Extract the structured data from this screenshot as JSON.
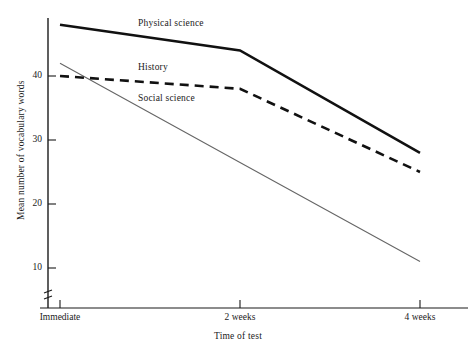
{
  "chart_data": {
    "type": "line",
    "title": "",
    "xlabel": "Time of test",
    "ylabel": "Mean number of vocabulary words",
    "categories": [
      "Immediate",
      "2 weeks",
      "4 weeks"
    ],
    "x": [
      0,
      2,
      4
    ],
    "xtick_labels": [
      "Immediate",
      "2 weeks",
      "4 weeks"
    ],
    "ytick_labels": [
      "40",
      "30",
      "20",
      "10"
    ],
    "yticks": [
      40,
      30,
      20,
      10
    ],
    "ylim": [
      6,
      50
    ],
    "xlim": [
      0,
      4
    ],
    "grid": false,
    "legend_position": "inline-annotations",
    "axis_break": true,
    "series": [
      {
        "name": "Physical science",
        "values": [
          48,
          44,
          28
        ],
        "style": "solid-thick",
        "color": "#111111",
        "label_position": "inline"
      },
      {
        "name": "History",
        "values": [
          40,
          38,
          25
        ],
        "style": "dashed-thick",
        "color": "#111111",
        "label_position": "inline"
      },
      {
        "name": "Social science",
        "values": [
          42,
          26.5,
          11
        ],
        "style": "solid-thin",
        "color": "#666666",
        "label_position": "inline"
      }
    ],
    "annotations": [
      {
        "text": "Physical science",
        "x": 1.05,
        "y": 48.6
      },
      {
        "text": "History",
        "x": 1.05,
        "y": 41.6
      },
      {
        "text": "Social science",
        "x": 1.05,
        "y": 36.6
      }
    ]
  },
  "axes": {
    "y_title": "Mean number of vocabulary words",
    "x_title": "Time of test"
  },
  "ticks": {
    "y": [
      {
        "label": "40",
        "value": 40
      },
      {
        "label": "30",
        "value": 30
      },
      {
        "label": "20",
        "value": 20
      },
      {
        "label": "10",
        "value": 10
      }
    ],
    "x": [
      {
        "label": "Immediate",
        "value": 0
      },
      {
        "label": "2 weeks",
        "value": 2
      },
      {
        "label": "4 weeks",
        "value": 4
      }
    ]
  },
  "series_labels": {
    "physical_science": "Physical science",
    "history": "History",
    "social_science": "Social science"
  },
  "colors": {
    "axis": "#1a1a1a",
    "physical_science": "#111111",
    "history": "#111111",
    "social_science": "#707070",
    "background": "#ffffff"
  }
}
